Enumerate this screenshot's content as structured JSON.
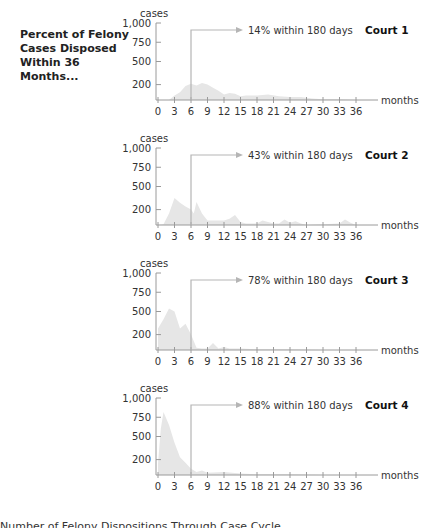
{
  "side_title": "Percent of Felony Cases Disposed Within 36 Months...",
  "caption": "Number of Felony Dispositions Through Case Cycle",
  "colors": {
    "area": "#e6e6e6",
    "axis": "#9a9a9a",
    "marker": "#b5b5b5",
    "text": "#333333"
  },
  "chart_data": [
    {
      "type": "area",
      "title": "Court 1",
      "annotation": "14% within 180 days",
      "xlabel": "months",
      "ylabel": "cases",
      "xticks": [
        "0",
        "3",
        "6",
        "9",
        "12",
        "15",
        "18",
        "21",
        "24",
        "27",
        "30",
        "33",
        "36"
      ],
      "yticks": [
        "1,000",
        "750",
        "500",
        "200"
      ],
      "ylim": [
        0,
        1000
      ],
      "xlim": [
        0,
        36
      ],
      "marker_x": 6,
      "x": [
        0,
        2,
        3,
        4,
        5,
        6,
        7,
        8,
        9,
        10,
        11,
        12,
        13,
        14,
        15,
        16,
        18,
        20,
        22,
        24,
        26,
        28,
        30,
        33,
        36
      ],
      "values": [
        0,
        0,
        60,
        100,
        180,
        210,
        190,
        220,
        200,
        160,
        120,
        70,
        90,
        80,
        50,
        60,
        60,
        70,
        50,
        40,
        40,
        20,
        10,
        10,
        0
      ]
    },
    {
      "type": "area",
      "title": "Court 2",
      "annotation": "43% within 180 days",
      "xlabel": "months",
      "ylabel": "cases",
      "xticks": [
        "0",
        "3",
        "6",
        "9",
        "12",
        "15",
        "18",
        "21",
        "24",
        "27",
        "30",
        "33",
        "36"
      ],
      "yticks": [
        "1,000",
        "750",
        "500",
        "200"
      ],
      "ylim": [
        0,
        1000
      ],
      "xlim": [
        0,
        36
      ],
      "marker_x": 6,
      "x": [
        0,
        1,
        2,
        3,
        4,
        5,
        6,
        6.5,
        7,
        8,
        9,
        12,
        13,
        14,
        15,
        16,
        18,
        19,
        20,
        21,
        22,
        23,
        24,
        25,
        26,
        27,
        33,
        34,
        35,
        36
      ],
      "values": [
        0,
        10,
        150,
        350,
        290,
        240,
        200,
        150,
        300,
        150,
        60,
        60,
        80,
        130,
        40,
        20,
        20,
        60,
        40,
        20,
        20,
        70,
        30,
        50,
        20,
        0,
        20,
        70,
        30,
        0
      ]
    },
    {
      "type": "area",
      "title": "Court 3",
      "annotation": "78% within 180 days",
      "xlabel": "months",
      "ylabel": "cases",
      "xticks": [
        "0",
        "3",
        "6",
        "9",
        "12",
        "15",
        "18",
        "21",
        "24",
        "27",
        "30",
        "33",
        "36"
      ],
      "yticks": [
        "1,000",
        "750",
        "500",
        "200"
      ],
      "ylim": [
        0,
        1000
      ],
      "xlim": [
        0,
        36
      ],
      "marker_x": 6,
      "x": [
        0,
        1,
        2,
        3,
        4,
        5,
        6,
        7,
        8,
        9,
        10,
        11,
        12,
        13,
        15,
        18,
        24,
        30,
        36
      ],
      "values": [
        280,
        400,
        540,
        500,
        280,
        340,
        200,
        30,
        20,
        20,
        90,
        20,
        40,
        20,
        20,
        10,
        10,
        0,
        0
      ],
      "note": "values near 0 months start high; peaks ~540 at 2 months, ~340 at 4.5 months"
    },
    {
      "type": "area",
      "title": "Court 4",
      "annotation": "88% within 180 days",
      "xlabel": "months",
      "ylabel": "cases",
      "xticks": [
        "0",
        "3",
        "6",
        "9",
        "12",
        "15",
        "18",
        "21",
        "24",
        "27",
        "30",
        "33",
        "36"
      ],
      "yticks": [
        "1,000",
        "750",
        "500",
        "200"
      ],
      "ylim": [
        0,
        1000
      ],
      "xlim": [
        0,
        36
      ],
      "marker_x": 6,
      "x": [
        0,
        0.5,
        1,
        2,
        3,
        4,
        5,
        6,
        7,
        8,
        9,
        12,
        15,
        18,
        24,
        30,
        36
      ],
      "values": [
        150,
        600,
        820,
        650,
        420,
        230,
        160,
        80,
        40,
        60,
        30,
        40,
        20,
        10,
        10,
        0,
        0
      ]
    }
  ]
}
